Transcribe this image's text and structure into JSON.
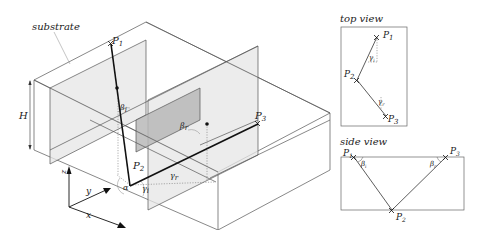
{
  "main_view": {
    "substrate_label": "substrate",
    "height_label": "H",
    "points": {
      "p1": {
        "base": "P",
        "sub": "1"
      },
      "p2": {
        "base": "P",
        "sub": "2"
      },
      "p3": {
        "base": "P",
        "sub": "3"
      }
    },
    "angles": {
      "alpha": "α",
      "beta_i": {
        "base": "β",
        "sub": "i"
      },
      "beta_r": {
        "base": "β",
        "sub": "r"
      },
      "gamma_i": {
        "base": "γ",
        "sub": "i"
      },
      "gamma_r": {
        "base": "γ",
        "sub": "r"
      }
    },
    "axes": {
      "x": "x",
      "y": "y",
      "z": "z"
    }
  },
  "top_view": {
    "title": "top view",
    "points": {
      "p1": {
        "base": "P",
        "sub": "1"
      },
      "p2": {
        "base": "P",
        "sub": "2"
      },
      "p3": {
        "base": "P",
        "sub": "3"
      }
    },
    "angles": {
      "gamma_i": {
        "base": "γ",
        "sub": "i"
      },
      "gamma_r": {
        "base": "γ",
        "sub": "r"
      }
    }
  },
  "side_view": {
    "title": "side view",
    "points": {
      "p1": {
        "base": "P",
        "sub": "1"
      },
      "p2": {
        "base": "P",
        "sub": "2"
      },
      "p3": {
        "base": "P",
        "sub": "3"
      }
    },
    "angles": {
      "beta_i": {
        "base": "β",
        "sub": "i"
      },
      "beta_r": {
        "base": "β",
        "sub": "r"
      }
    }
  },
  "colors": {
    "ray": "#111111",
    "edges": "#555555",
    "plane_fill": "#e6e6e6",
    "plane_dark": "#b8b8b8"
  }
}
